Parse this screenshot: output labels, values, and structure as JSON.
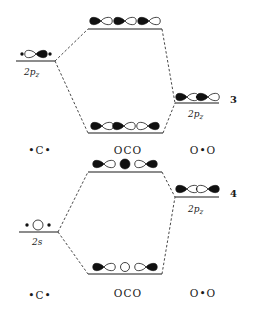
{
  "figure": {
    "diagram_3": {
      "number": "3",
      "left_level_label": "2p",
      "left_level_sub": "z",
      "right_level_label": "2p",
      "right_level_sub": "z",
      "fragment_labels": [
        "•C•",
        "OCO",
        "O•O"
      ]
    },
    "diagram_4": {
      "number": "4",
      "left_level_label": "2s",
      "right_level_label": "2p",
      "right_level_sub": "z",
      "fragment_labels": [
        "•C•",
        "OCO",
        "O•O"
      ]
    }
  }
}
